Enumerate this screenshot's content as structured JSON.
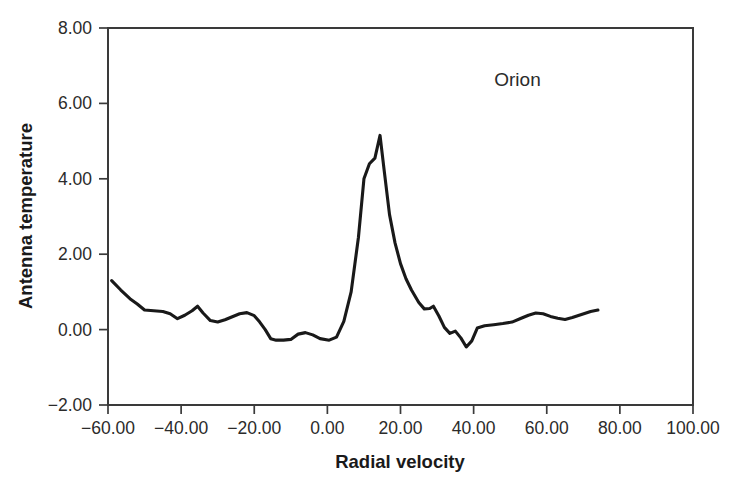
{
  "figure": {
    "background_color": "#ffffff",
    "line_color": "#191919",
    "axis_color": "#3a3a3a",
    "text_color": "#2b2b2b"
  },
  "annotation": {
    "text": "Orion",
    "x_data": 52.0,
    "y_data": 6.45
  },
  "chart_data": {
    "type": "line",
    "title": "",
    "subtitle": "",
    "xlabel": "Radial velocity",
    "ylabel": "Antenna temperature",
    "xlim": [
      -60.0,
      100.0
    ],
    "ylim": [
      -2.0,
      8.0
    ],
    "grid": false,
    "legend": null,
    "legend_position": "none",
    "xticks": [
      -60.0,
      -40.0,
      -20.0,
      0.0,
      20.0,
      40.0,
      60.0,
      80.0,
      100.0
    ],
    "xticklabels": [
      "−60.00",
      "−40.00",
      "−20.00",
      "0.00",
      "20.00",
      "40.00",
      "60.00",
      "80.00",
      "100.00"
    ],
    "yticks": [
      -2.0,
      0.0,
      2.0,
      4.0,
      6.0,
      8.0
    ],
    "yticklabels": [
      "−2.00",
      "0.00",
      "2.00",
      "4.00",
      "6.00",
      "8.00"
    ],
    "annotations": [
      {
        "text": "Orion",
        "x": 52.0,
        "y": 6.45
      }
    ],
    "series": [
      {
        "name": "Orion spectrum",
        "color": "#191919",
        "x": [
          -59.0,
          -56.5,
          -54.0,
          -52.0,
          -50.0,
          -47.5,
          -45.0,
          -43.0,
          -41.0,
          -39.0,
          -37.0,
          -35.5,
          -34.0,
          -32.0,
          -30.0,
          -28.0,
          -26.0,
          -24.0,
          -22.0,
          -20.0,
          -18.5,
          -17.0,
          -15.5,
          -14.0,
          -12.0,
          -10.0,
          -8.0,
          -6.0,
          -4.0,
          -2.0,
          0.5,
          2.5,
          4.5,
          6.5,
          8.5,
          10.0,
          11.5,
          13.0,
          14.4,
          15.5,
          17.0,
          18.5,
          20.0,
          21.5,
          23.0,
          25.0,
          26.5,
          28.0,
          29.0,
          30.5,
          32.0,
          33.5,
          35.0,
          36.5,
          38.0,
          39.5,
          41.0,
          43.0,
          45.5,
          48.0,
          50.5,
          53.0,
          55.0,
          57.0,
          59.0,
          61.0,
          63.0,
          65.0,
          67.0,
          69.5,
          72.0,
          74.0
        ],
        "y": [
          1.3,
          1.05,
          0.82,
          0.68,
          0.52,
          0.5,
          0.48,
          0.42,
          0.29,
          0.38,
          0.5,
          0.62,
          0.44,
          0.24,
          0.2,
          0.26,
          0.34,
          0.42,
          0.45,
          0.37,
          0.2,
          0.0,
          -0.24,
          -0.28,
          -0.28,
          -0.26,
          -0.12,
          -0.08,
          -0.14,
          -0.24,
          -0.28,
          -0.2,
          0.22,
          1.0,
          2.45,
          4.0,
          4.4,
          4.55,
          5.15,
          4.25,
          3.05,
          2.3,
          1.75,
          1.35,
          1.05,
          0.72,
          0.55,
          0.56,
          0.62,
          0.36,
          0.06,
          -0.1,
          -0.04,
          -0.22,
          -0.46,
          -0.3,
          0.04,
          0.1,
          0.13,
          0.16,
          0.2,
          0.3,
          0.38,
          0.44,
          0.42,
          0.35,
          0.3,
          0.27,
          0.32,
          0.4,
          0.48,
          0.52
        ]
      }
    ]
  }
}
